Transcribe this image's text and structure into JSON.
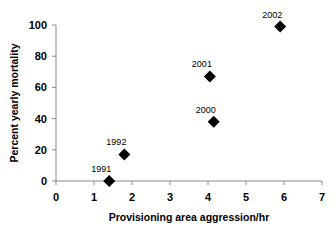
{
  "chart_data": {
    "type": "scatter",
    "title": "",
    "xlabel": "Provisioning area aggression/hr",
    "ylabel": "Percent yearly mortality",
    "xlim": [
      0,
      7
    ],
    "ylim": [
      0,
      100
    ],
    "xticks": [
      "0",
      "1",
      "2",
      "3",
      "4",
      "5",
      "6",
      "7"
    ],
    "yticks": [
      "0",
      "20",
      "40",
      "60",
      "80",
      "100"
    ],
    "grid": false,
    "legend": null,
    "marker": "diamond",
    "points": [
      {
        "label": "1991",
        "x": 1.4,
        "y": 0
      },
      {
        "label": "1992",
        "x": 1.8,
        "y": 17
      },
      {
        "label": "2000",
        "x": 4.15,
        "y": 38
      },
      {
        "label": "2001",
        "x": 4.05,
        "y": 67
      },
      {
        "label": "2002",
        "x": 5.9,
        "y": 99
      }
    ]
  }
}
